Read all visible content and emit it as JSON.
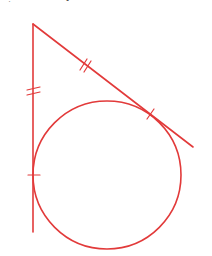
{
  "diagram": {
    "type": "geometry-figure",
    "stroke_color": "#e23a3a",
    "apex": {
      "x": 33,
      "y": 24
    },
    "vertical_line": {
      "x1": 33,
      "y1": 24,
      "x2": 33,
      "y2": 232
    },
    "slanted_line": {
      "x1": 33,
      "y1": 24,
      "x2": 193,
      "y2": 147
    },
    "circle": {
      "cx": 107,
      "cy": 175,
      "r": 74
    },
    "tick_marks": [
      {
        "segment": "vertical-upper",
        "count": 2,
        "x": 33,
        "y": 92
      },
      {
        "segment": "slanted-upper",
        "count": 2,
        "x": 86,
        "y": 65
      },
      {
        "segment": "vertical-tangent-point",
        "count": 1,
        "x": 33,
        "y": 175
      },
      {
        "segment": "slanted-tangent-point",
        "count": 1,
        "x": 150,
        "y": 114
      }
    ],
    "top_artifacts": [
      "",
      ""
    ]
  }
}
